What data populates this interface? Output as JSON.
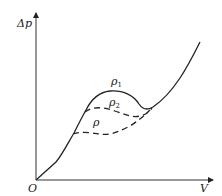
{
  "diagram": {
    "type": "characteristic-curve",
    "axes": {
      "y_label": "Δp",
      "x_label": "V",
      "origin_label": "O"
    },
    "curves": [
      {
        "name": "rho1-curve",
        "label": "ρ",
        "subscript": "1",
        "style": "solid"
      },
      {
        "name": "rho2-curve",
        "label": "ρ",
        "subscript": "2",
        "style": "dashed"
      },
      {
        "name": "rho-curve",
        "label": "ρ",
        "subscript": "",
        "style": "dashed"
      }
    ],
    "colors": {
      "line": "#222222",
      "background": "#ffffff"
    }
  }
}
